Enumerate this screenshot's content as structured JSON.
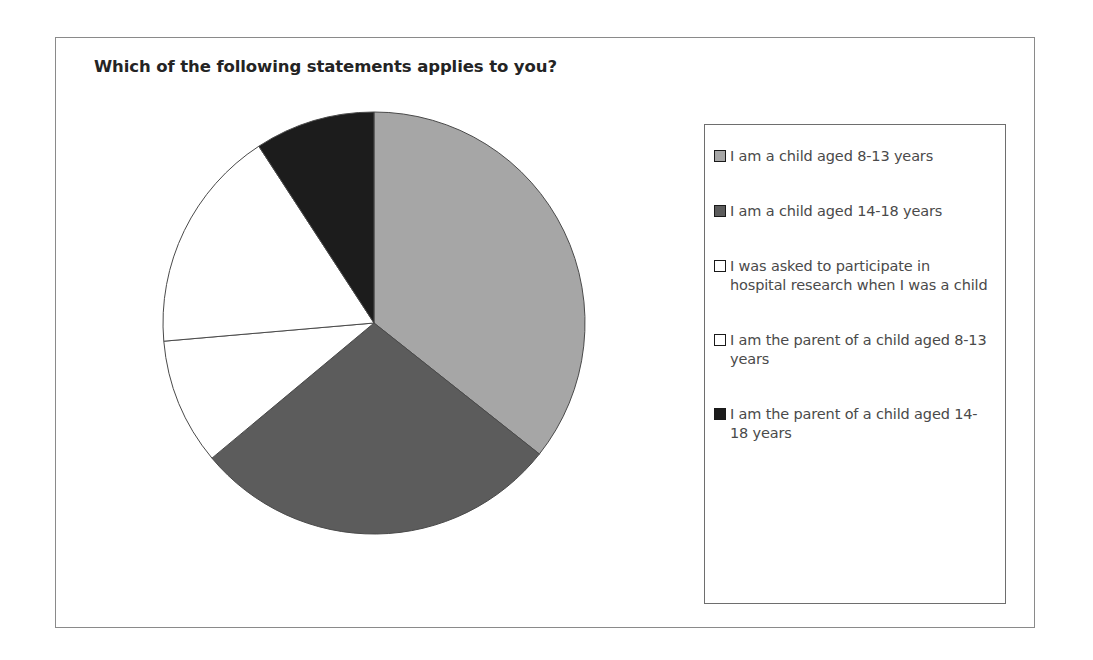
{
  "chart": {
    "title": "Which of the following statements applies to you?"
  },
  "legend": {
    "items": [
      {
        "label": "I am a child aged 8-13 years",
        "color": "#a6a6a6",
        "border": "#1a1a1a"
      },
      {
        "label": "I am a child aged 14-18 years",
        "color": "#5c5c5c",
        "border": "#1a1a1a"
      },
      {
        "label": "I was asked to participate in hospital research when I was a child",
        "color": "#ffffff",
        "border": "#1a1a1a"
      },
      {
        "label": "I am the parent of a child aged 8-13 years",
        "color": "#ffffff",
        "border": "#1a1a1a"
      },
      {
        "label": "I am the parent of a child aged 14-18 years",
        "color": "#1c1c1c",
        "border": "#1a1a1a"
      }
    ]
  },
  "chart_data": {
    "type": "pie",
    "title": "Which of the following statements applies to you?",
    "xlabel": "",
    "ylabel": "",
    "legend_position": "right",
    "grid": false,
    "start_angle_deg": 0,
    "direction": "clockwise",
    "categories": [
      "I am a child aged 8-13 years",
      "I am a child aged 14-18 years",
      "I was asked to participate in hospital research when I was a child",
      "I am the parent of a child aged 8-13 years",
      "I am the parent of a child aged 14-18 years"
    ],
    "values": [
      35.7,
      28.3,
      9.7,
      17.2,
      9.2
    ],
    "unit": "percent",
    "angles_deg": [
      128.5,
      101.8,
      34.8,
      61.8,
      33.1
    ],
    "colors": [
      "#a6a6a6",
      "#5c5c5c",
      "#ffffff",
      "#ffffff",
      "#1c1c1c"
    ],
    "slice_edge_color": "#4a4a4a"
  }
}
